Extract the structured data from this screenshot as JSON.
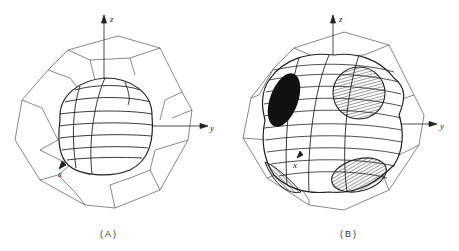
{
  "figure": {
    "panels": [
      {
        "id": "A",
        "caption": "(A)",
        "axes": {
          "z": "z",
          "y": "y",
          "x": "x"
        },
        "description": "Near-spherical surface inside truncated octahedron"
      },
      {
        "id": "B",
        "caption": "(B)",
        "axes": {
          "z": "z",
          "y": "y",
          "x": "x"
        },
        "description": "Surface contacting hexagonal faces with necks (hatched / black regions)"
      }
    ],
    "colors": {
      "line": "#333333",
      "thin_line": "#555555",
      "fill_black": "#111111",
      "background": "#ffffff"
    }
  }
}
